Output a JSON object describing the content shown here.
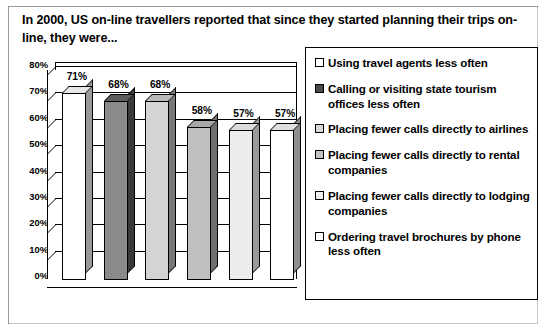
{
  "chart_title": "In 2000, US on-line travellers reported that since they started planning their trips on-line, they were...",
  "chart_data": {
    "type": "bar",
    "title": "In 2000, US on-line travellers reported that since they started planning their trips on-line, they were...",
    "xlabel": "",
    "ylabel": "",
    "ylim": [
      0,
      80
    ],
    "grid": true,
    "legend_position": "right",
    "categories": [
      "Using travel agents less often",
      "Calling or visiting state tourism offices less often",
      "Placing fewer calls directly to airlines",
      "Placing fewer calls directly to rental companies",
      "Placing fewer calls directly to lodging companies",
      "Ordering travel brochures by phone less often"
    ],
    "values": [
      71,
      68,
      68,
      58,
      57,
      57
    ],
    "data_labels": [
      "71%",
      "68%",
      "68%",
      "58%",
      "57%",
      "57%"
    ],
    "ytick_labels": [
      "80%",
      "70%",
      "60%",
      "50%",
      "40%",
      "30%",
      "20%",
      "10%",
      "0%"
    ],
    "ytick_values": [
      80,
      70,
      60,
      50,
      40,
      30,
      20,
      10,
      0
    ],
    "bar_colors": [
      "#ffffff",
      "#8a8a8a",
      "#d4d4d4",
      "#c0c0c0",
      "#ededed",
      "#ffffff"
    ],
    "bar_side_colors": [
      "#9a9a9a",
      "#3a3a3a",
      "#787878",
      "#6e6e6e",
      "#9a9a9a",
      "#8f8f8f"
    ],
    "bar_top_colors": [
      "#e8e8e8",
      "#5c5c5c",
      "#b8b8b8",
      "#a8a8a8",
      "#dcdcdc",
      "#e0e0e0"
    ]
  },
  "legend": {
    "items": [
      {
        "label": "Using travel agents less often",
        "swatch": "#ffffff"
      },
      {
        "label": "Calling or visiting state tourism offices less often",
        "swatch": "#4a4a4a"
      },
      {
        "label": "Placing fewer calls directly to airlines",
        "swatch": "#d9d9d9"
      },
      {
        "label": "Placing fewer calls directly to rental companies",
        "swatch": "#c2c2c2"
      },
      {
        "label": "Placing fewer calls directly to lodging companies",
        "swatch": "#efefef"
      },
      {
        "label": "Ordering travel brochures by phone less often",
        "swatch": "#ffffff"
      }
    ]
  }
}
